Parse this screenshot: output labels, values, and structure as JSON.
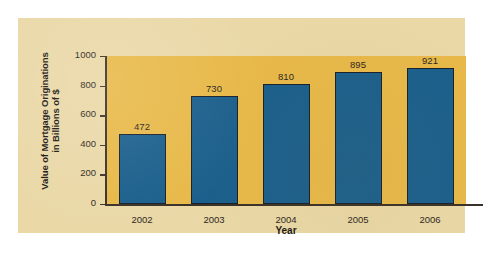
{
  "chart_data": {
    "type": "bar",
    "title": "",
    "xlabel": "Year",
    "ylabel": "Value of Mortgage Originations in Billions of $",
    "ylabel_lines": [
      "Value of Mortgage Originations",
      "in Billions of $"
    ],
    "categories": [
      "2002",
      "2003",
      "2004",
      "2005",
      "2006"
    ],
    "values": [
      472,
      730,
      810,
      895,
      921
    ],
    "value_labels": [
      "472",
      "730",
      "810",
      "895",
      "921"
    ],
    "ylim": [
      0,
      1000
    ],
    "yticks": [
      1000,
      800,
      600,
      400,
      200,
      0
    ],
    "ytick_labels": [
      "1000",
      "800",
      "600",
      "400",
      "200",
      "0"
    ],
    "grid": false,
    "legend": false,
    "series": [
      {
        "name": "Value of Mortgage Originations",
        "values": [
          472,
          730,
          810,
          895,
          921
        ]
      }
    ]
  },
  "colors": {
    "bar_fill": "#1a5f8c",
    "bar_outline": "#17202a",
    "plot_background": "#e8b949",
    "card_background": "#ead8a7",
    "page_background": "#ffffff",
    "axis_line": "#3a3228",
    "text": "#2b2720"
  }
}
